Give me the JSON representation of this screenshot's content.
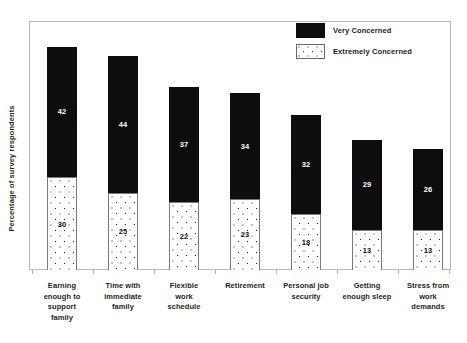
{
  "chart_data": {
    "type": "bar",
    "subtype": "stacked-bar",
    "title": "",
    "xlabel": "",
    "ylabel": "Percentage of survey respondents",
    "ylim": [
      0,
      80
    ],
    "grid": false,
    "y_tick_labels": [],
    "legend_position": "top-right",
    "categories": [
      "Earning enough to support family",
      "Time with immediate family",
      "Flexible work schedule",
      "Retirement",
      "Personal job security",
      "Getting enough sleep",
      "Stress from work demands"
    ],
    "series": [
      {
        "name": "Very Concerned",
        "color": "#0d0d0d",
        "values": [
          42,
          44,
          37,
          34,
          32,
          29,
          26
        ]
      },
      {
        "name": "Extremely Concerned",
        "color": "#ffffff",
        "values": [
          30,
          25,
          22,
          23,
          18,
          13,
          13
        ]
      }
    ],
    "totals": [
      72,
      69,
      59,
      57,
      50,
      42,
      39
    ]
  },
  "legend": {
    "items": [
      {
        "label": "Very Concerned",
        "swatch": "solid-black-swatch"
      },
      {
        "label": "Extremely Concerned",
        "swatch": "dotted-white-swatch"
      }
    ]
  },
  "axis": {
    "y_title": "Percentage of survey respondents"
  },
  "labels": {
    "cat0_l0": "Earning",
    "cat0_l1": "enough to",
    "cat0_l2": "support",
    "cat0_l3": "family",
    "cat1_l0": "Time with",
    "cat1_l1": "immediate",
    "cat1_l2": "family",
    "cat2_l0": "Flexible",
    "cat2_l1": "work",
    "cat2_l2": "schedule",
    "cat3_l0": "Retirement",
    "cat4_l0": "Personal job",
    "cat4_l1": "security",
    "cat5_l0": "Getting",
    "cat5_l1": "enough sleep",
    "cat6_l0": "Stress from",
    "cat6_l1": "work",
    "cat6_l2": "demands"
  },
  "values": {
    "very": [
      "42",
      "44",
      "37",
      "34",
      "32",
      "29",
      "26"
    ],
    "extremely": [
      "30",
      "25",
      "22",
      "23",
      "18",
      "13",
      "13"
    ]
  }
}
